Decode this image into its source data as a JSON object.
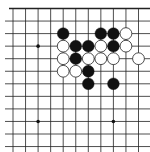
{
  "game": "go",
  "board": {
    "view": "top edge visible, partial board",
    "visible_columns": 12,
    "visible_rows": 12,
    "edges_shown": [
      "top"
    ],
    "colors": {
      "background": "#ffffff",
      "line": "#222222",
      "black_stone": "#111111",
      "white_stone_fill": "#ffffff",
      "white_stone_stroke": "#222222",
      "star_point": "#111111"
    },
    "star_points": [
      {
        "col": 2,
        "row": 3
      },
      {
        "col": 2,
        "row": 9
      },
      {
        "col": 8,
        "row": 9
      }
    ],
    "stones": [
      {
        "color": "black",
        "col": 4,
        "row": 2
      },
      {
        "color": "black",
        "col": 7,
        "row": 2
      },
      {
        "color": "black",
        "col": 8,
        "row": 2
      },
      {
        "color": "white",
        "col": 9,
        "row": 2
      },
      {
        "color": "white",
        "col": 4,
        "row": 3
      },
      {
        "color": "black",
        "col": 5,
        "row": 3
      },
      {
        "color": "black",
        "col": 6,
        "row": 3
      },
      {
        "color": "white",
        "col": 7,
        "row": 3
      },
      {
        "color": "black",
        "col": 8,
        "row": 3
      },
      {
        "color": "white",
        "col": 9,
        "row": 3
      },
      {
        "color": "white",
        "col": 4,
        "row": 4
      },
      {
        "color": "black",
        "col": 5,
        "row": 4
      },
      {
        "color": "white",
        "col": 6,
        "row": 4
      },
      {
        "color": "white",
        "col": 7,
        "row": 4
      },
      {
        "color": "white",
        "col": 8,
        "row": 4
      },
      {
        "color": "white",
        "col": 10,
        "row": 4
      },
      {
        "color": "white",
        "col": 4,
        "row": 5
      },
      {
        "color": "white",
        "col": 5,
        "row": 5
      },
      {
        "color": "black",
        "col": 6,
        "row": 5
      },
      {
        "color": "black",
        "col": 6,
        "row": 6
      },
      {
        "color": "black",
        "col": 8,
        "row": 6
      }
    ]
  }
}
